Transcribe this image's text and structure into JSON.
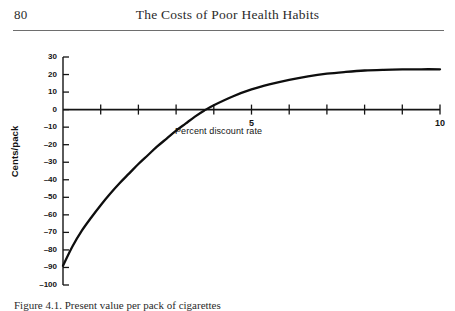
{
  "page": {
    "number": "80",
    "running_head": "The Costs of Poor Health Habits",
    "caption": "Figure 4.1.  Present value per pack of cigarettes"
  },
  "chart_data": {
    "type": "line",
    "title": "",
    "xlabel": "Percent discount rate",
    "ylabel": "Cents/pack",
    "xlim": [
      0,
      10
    ],
    "ylim": [
      -100,
      30
    ],
    "grid": false,
    "legend": "none",
    "x_tick_labels": [
      "5",
      "10"
    ],
    "x_tick_label_values": [
      5,
      10
    ],
    "x_ticks": [
      0,
      1,
      2,
      3,
      4,
      5,
      6,
      7,
      8,
      9,
      10
    ],
    "y_ticks": [
      30,
      20,
      10,
      0,
      -10,
      -20,
      -30,
      -40,
      -50,
      -60,
      -70,
      -80,
      -90,
      -100
    ],
    "y_tick_labels": [
      "30",
      "20",
      "10",
      "0",
      "–10",
      "–20",
      "–30",
      "–40",
      "–50",
      "–60",
      "–70",
      "–80",
      "–90",
      "–100"
    ],
    "series": [
      {
        "name": "Present value per pack",
        "x": [
          0.0,
          0.25,
          0.5,
          0.75,
          1.0,
          1.25,
          1.5,
          1.75,
          2.0,
          2.25,
          2.5,
          2.75,
          3.0,
          3.25,
          3.5,
          3.75,
          4.0,
          4.5,
          5.0,
          5.5,
          6.0,
          6.5,
          7.0,
          7.5,
          8.0,
          8.5,
          9.0,
          9.5,
          10.0
        ],
        "values": [
          -89.0,
          -78.0,
          -69.0,
          -61.5,
          -54.5,
          -48.0,
          -42.0,
          -36.5,
          -31.0,
          -26.0,
          -21.0,
          -16.5,
          -12.0,
          -8.0,
          -4.0,
          -0.5,
          2.5,
          7.5,
          11.5,
          14.5,
          17.0,
          19.0,
          20.5,
          21.5,
          22.3,
          22.7,
          22.9,
          23.0,
          23.0
        ],
        "zero_crossing_x": 3.65,
        "asymptote_value": 23.0,
        "start_value": -89.0
      }
    ]
  }
}
